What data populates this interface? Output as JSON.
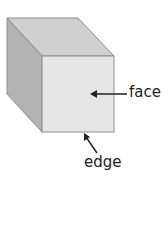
{
  "diagram": {
    "type": "cube",
    "colors": {
      "front_face": "#e6e6e6",
      "top_face": "#cfcfcf",
      "side_face": "#b3b3b3",
      "edge_stroke": "#8c8c8c",
      "arrow": "#222222"
    },
    "labels": {
      "face": "face",
      "edge": "edge"
    }
  }
}
